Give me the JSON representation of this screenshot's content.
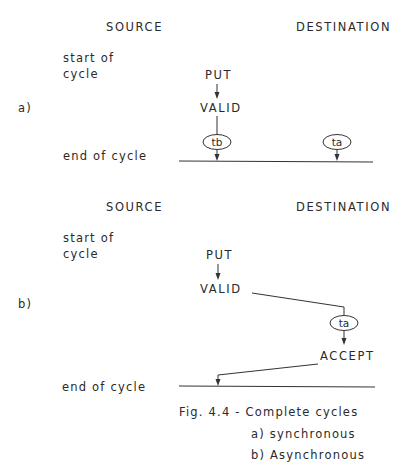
{
  "figure": {
    "caption": {
      "title": "Fig. 4.4 - Complete cycles",
      "line_a": "a) synchronous",
      "line_b": "b) Asynchronous"
    }
  },
  "panel_a": {
    "label": "a)",
    "source_header": "SOURCE",
    "destination_header": "DESTINATION",
    "start_label_1": "start of",
    "start_label_2": "cycle",
    "end_label": "end of cycle",
    "signal_put": "PUT",
    "signal_valid": "VALID",
    "delay_source": "tb",
    "delay_destination": "ta"
  },
  "panel_b": {
    "label": "b)",
    "source_header": "SOURCE",
    "destination_header": "DESTINATION",
    "start_label_1": "start of",
    "start_label_2": "cycle",
    "end_label": "end of cycle",
    "signal_put": "PUT",
    "signal_valid": "VALID",
    "delay_destination": "ta",
    "signal_accept": "ACCEPT"
  }
}
